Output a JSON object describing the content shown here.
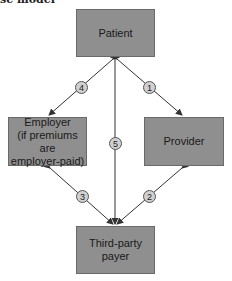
{
  "caption": "se model",
  "nodes": {
    "patient": {
      "label": "Patient"
    },
    "employer": {
      "line1": "Employer",
      "line2": "(if premiums are",
      "line3": "employer-paid)"
    },
    "provider": {
      "label": "Provider"
    },
    "payer": {
      "line1": "Third-party",
      "line2": "payer"
    }
  },
  "edges": [
    {
      "number": "1",
      "from": "Patient",
      "to": "Provider"
    },
    {
      "number": "2",
      "from": "Provider",
      "to": "Third-party payer"
    },
    {
      "number": "3",
      "from": "Employer",
      "to": "Third-party payer"
    },
    {
      "number": "4",
      "from": "Patient",
      "to": "Employer"
    },
    {
      "number": "5",
      "from": "Patient",
      "to": "Third-party payer"
    }
  ],
  "colors": {
    "box_fill": "#8f8f8f",
    "badge_fill": "#d0d0d0",
    "line": "#333333"
  }
}
